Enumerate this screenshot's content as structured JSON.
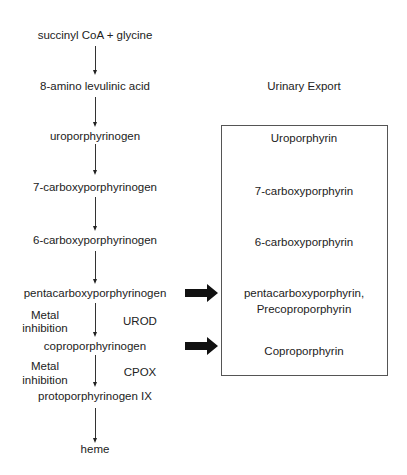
{
  "pathway": {
    "steps": [
      {
        "label": "succinyl CoA + glycine",
        "y": 35
      },
      {
        "label": "8-amino levulinic acid",
        "y": 86
      },
      {
        "label": "uroporphyrinogen",
        "y": 136
      },
      {
        "label": "7-carboxyporphyrinogen",
        "y": 187
      },
      {
        "label": "6-carboxyporphyrinogen",
        "y": 240
      },
      {
        "label": "pentacarboxyporphyrinogen",
        "y": 293
      },
      {
        "label": "coproporphyrinogen",
        "y": 346
      },
      {
        "label": "protoporphyrinogen IX",
        "y": 396
      },
      {
        "label": "heme",
        "y": 449
      }
    ],
    "annotations": {
      "urod": {
        "enzyme": "UROD",
        "inhibitor_line1": "Metal",
        "inhibitor_line2": "inhibition"
      },
      "cpox": {
        "enzyme": "CPOX",
        "inhibitor_line1": "Metal",
        "inhibitor_line2": "inhibition"
      }
    }
  },
  "urinary_export": {
    "title": "Urinary Export",
    "items": [
      {
        "label": "Uroporphyrin"
      },
      {
        "label": "7-carboxyporphyrin"
      },
      {
        "label": "6-carboxyporphyrin"
      },
      {
        "label": "pentacarboxyporphyrin,",
        "label2": "Precoproporphyrin"
      },
      {
        "label": "Coproporphyrin"
      }
    ]
  },
  "colors": {
    "text": "#222222",
    "arrow": "#111111",
    "box_border": "#555555"
  }
}
